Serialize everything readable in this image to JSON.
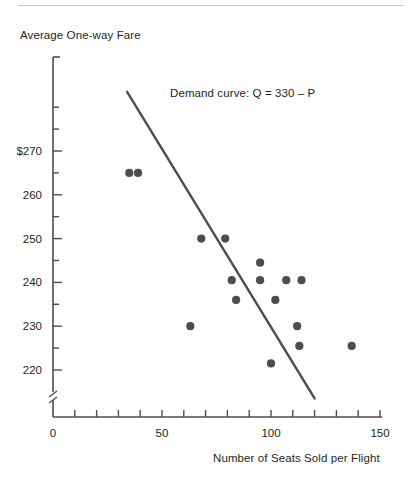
{
  "figure": {
    "y_axis_title": "Average One-way Fare",
    "x_axis_title": "Number of Seats Sold per Flight",
    "curve_label": "Demand curve: Q = 330 – P"
  },
  "colors": {
    "axis": "#4d4d4d",
    "marker": "#4d4d4d",
    "line": "#4d4d4d",
    "text": "#231f20",
    "rule": "#c9c9c9"
  },
  "axes": {
    "y_ticks_labeled": [
      "$270",
      "260",
      "250",
      "240",
      "230",
      "220"
    ],
    "y_tick_values": [
      270,
      260,
      250,
      240,
      230,
      220
    ],
    "y_minor_step": 5,
    "x_ticks_labeled": [
      "0",
      "50",
      "100",
      "150"
    ],
    "x_tick_values": [
      0,
      50,
      100,
      150
    ],
    "x_minor_step": 10,
    "axis_break": true
  },
  "chart_data": {
    "type": "scatter",
    "title": "",
    "xlabel": "Number of Seats Sold per Flight",
    "ylabel": "Average One-way Fare",
    "xlim": [
      0,
      150
    ],
    "ylim": [
      213,
      285
    ],
    "grid": false,
    "legend": "none",
    "annotations": [
      {
        "text": "Demand curve: Q = 330 – P",
        "x": 88,
        "y": 272
      }
    ],
    "series": [
      {
        "name": "Observed flights",
        "type": "scatter",
        "marker": "filled-circle",
        "color": "#4d4d4d",
        "points": [
          {
            "x": 35,
            "y": 265
          },
          {
            "x": 39,
            "y": 265
          },
          {
            "x": 63,
            "y": 230
          },
          {
            "x": 68,
            "y": 250
          },
          {
            "x": 79,
            "y": 250
          },
          {
            "x": 82,
            "y": 240.5
          },
          {
            "x": 84,
            "y": 236
          },
          {
            "x": 95,
            "y": 244.5
          },
          {
            "x": 95,
            "y": 240.5
          },
          {
            "x": 100,
            "y": 221.5
          },
          {
            "x": 102,
            "y": 236
          },
          {
            "x": 107,
            "y": 240.5
          },
          {
            "x": 112,
            "y": 230
          },
          {
            "x": 113,
            "y": 225.5
          },
          {
            "x": 114,
            "y": 240.5
          },
          {
            "x": 137,
            "y": 225.5
          }
        ]
      },
      {
        "name": "Demand curve: Q = 330 – P",
        "type": "line",
        "color": "#4d4d4d",
        "equation": "Q = 330 - P",
        "endpoints": [
          {
            "x": 34,
            "y": 283.5
          },
          {
            "x": 120,
            "y": 213.5
          }
        ]
      }
    ]
  }
}
